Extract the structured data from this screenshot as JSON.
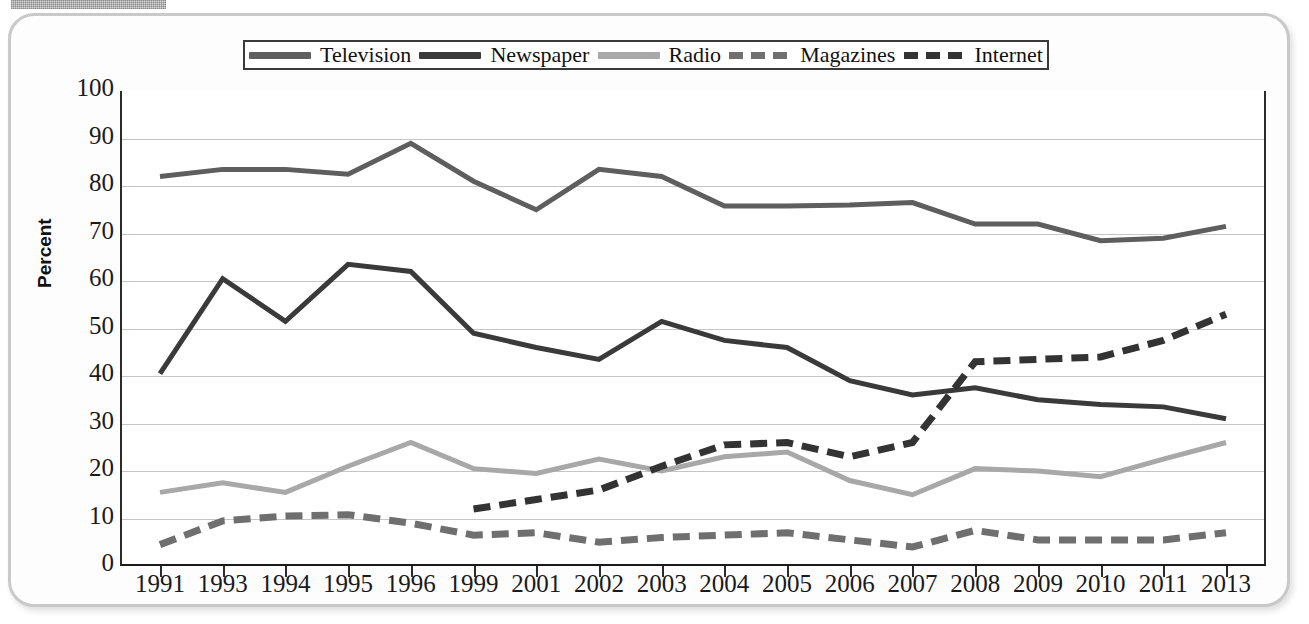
{
  "figure": {
    "ylabel": "Percent",
    "scan_artifact": "halftone-bar"
  },
  "legend": {
    "items": [
      {
        "label": "Television",
        "style": "solid",
        "color": "#5e5e5e"
      },
      {
        "label": "Newspaper",
        "style": "solid",
        "color": "#3a3a3a"
      },
      {
        "label": "Radio",
        "style": "solid",
        "color": "#a8a8a8"
      },
      {
        "label": "Magazines",
        "style": "dashed",
        "color": "#6f6f6f"
      },
      {
        "label": "Internet",
        "style": "dashed",
        "color": "#333333"
      }
    ]
  },
  "chart_data": {
    "type": "line",
    "title": "",
    "xlabel": "",
    "ylabel": "Percent",
    "ylim": [
      0,
      100
    ],
    "yticks": [
      0,
      10,
      20,
      30,
      40,
      50,
      60,
      70,
      80,
      90,
      100
    ],
    "grid": true,
    "legend_position": "top",
    "categories": [
      "1991",
      "1993",
      "1994",
      "1995",
      "1996",
      "1999",
      "2001",
      "2002",
      "2003",
      "2004",
      "2005",
      "2006",
      "2007",
      "2008",
      "2009",
      "2010",
      "2011",
      "2013"
    ],
    "series": [
      {
        "name": "Television",
        "style": "solid",
        "color": "#5e5e5e",
        "values": [
          82,
          83.5,
          83.5,
          82.5,
          89,
          81,
          75,
          83.5,
          82,
          75.8,
          75.8,
          76,
          76.5,
          72,
          72,
          68.5,
          69,
          71.5
        ]
      },
      {
        "name": "Newspaper",
        "style": "solid",
        "color": "#3a3a3a",
        "values": [
          40.5,
          60.5,
          51.5,
          63.5,
          62,
          49,
          46,
          43.5,
          51.5,
          47.5,
          46,
          39,
          36,
          37.5,
          35,
          34,
          33.5,
          31
        ]
      },
      {
        "name": "Radio",
        "style": "solid",
        "color": "#a8a8a8",
        "values": [
          15.5,
          17.5,
          15.5,
          21,
          26,
          20.5,
          19.5,
          22.5,
          20,
          23,
          24,
          18,
          15,
          20.5,
          20,
          18.8,
          22.5,
          26
        ]
      },
      {
        "name": "Magazines",
        "style": "dashed",
        "color": "#6f6f6f",
        "values": [
          4.5,
          9.5,
          10.5,
          10.8,
          9,
          6.5,
          7,
          5,
          6,
          6.5,
          7,
          5.5,
          4,
          7.5,
          5.5,
          5.5,
          5.5,
          7
        ]
      },
      {
        "name": "Internet",
        "style": "dashed",
        "color": "#333333",
        "values": [
          null,
          null,
          null,
          null,
          null,
          12,
          14,
          16,
          21,
          25.5,
          26,
          23,
          26,
          43,
          43.5,
          44,
          47.5,
          53
        ]
      }
    ]
  }
}
